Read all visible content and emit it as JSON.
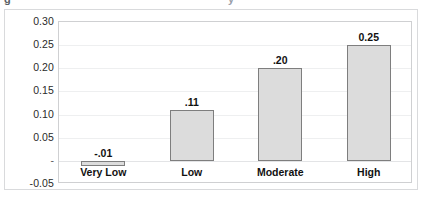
{
  "title_remnant": {
    "left_glyph": "g",
    "right_glyph": "y"
  },
  "chart_data": {
    "type": "bar",
    "title": "",
    "xlabel": "",
    "ylabel": "",
    "categories": [
      "Very Low",
      "Low",
      "Moderate",
      "High"
    ],
    "values": [
      -0.01,
      0.11,
      0.2,
      0.25
    ],
    "data_labels": [
      "-.01",
      ".11",
      ".20",
      "0.25"
    ],
    "ylim": [
      -0.05,
      0.3
    ],
    "yticks": [
      0.3,
      0.25,
      0.2,
      0.15,
      0.1,
      0.05,
      0.0,
      -0.05
    ],
    "ytick_labels": [
      "0.30",
      "0.25",
      "0.20",
      "0.15",
      "0.10",
      "0.05",
      "-",
      "-0.05"
    ],
    "grid": true,
    "legend": "none",
    "bar_fill": "#dcdcdc",
    "bar_border": "#7e7e7e",
    "gridline_color": "#eeeff0",
    "plot_border_color": "#cfd0d2",
    "frame_border_color": "#d9dadc",
    "background": "#ffffff"
  }
}
